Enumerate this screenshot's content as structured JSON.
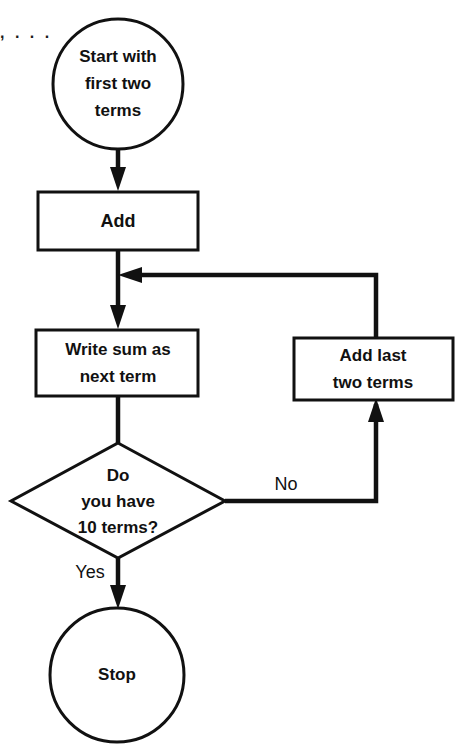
{
  "diagram": {
    "type": "flowchart",
    "background_color": "#ffffff",
    "stroke_color": "#111111",
    "fill_color": "#ffffff",
    "corner_fragment": ", . . ."
  },
  "nodes": {
    "start": {
      "shape": "circle",
      "lines": [
        "Start with",
        "first two",
        "terms"
      ],
      "line1": "Start with",
      "line2": "first two",
      "line3": "terms",
      "cx": 118,
      "cy": 84,
      "r": 65
    },
    "add": {
      "shape": "rectangle",
      "label": "Add",
      "x": 38,
      "y": 192,
      "w": 160,
      "h": 58
    },
    "write_sum": {
      "shape": "rectangle",
      "lines": [
        "Write sum as",
        "next term"
      ],
      "line1": "Write sum as",
      "line2": "next term",
      "x": 36,
      "y": 330,
      "w": 162,
      "h": 66
    },
    "decision": {
      "shape": "diamond",
      "lines": [
        "Do",
        "you have",
        "10 terms?"
      ],
      "line1": "Do",
      "line2": "you have",
      "line3": "10 terms?",
      "cx": 118,
      "cy": 501,
      "rx": 107,
      "ry": 58
    },
    "add_last_two": {
      "shape": "rectangle",
      "lines": [
        "Add last",
        "two terms"
      ],
      "line1": "Add last",
      "line2": "two terms",
      "x": 294,
      "y": 338,
      "w": 159,
      "h": 62
    },
    "stop": {
      "shape": "circle",
      "label": "Stop",
      "cx": 117,
      "cy": 675,
      "r": 67
    }
  },
  "edges": {
    "start_to_add": {
      "from": "start",
      "to": "add",
      "label": ""
    },
    "add_to_write_sum": {
      "from": "add",
      "to": "write_sum",
      "label": ""
    },
    "write_sum_to_decision": {
      "from": "write_sum",
      "to": "decision",
      "label": ""
    },
    "decision_no": {
      "from": "decision",
      "to": "add_last_two",
      "label": "No",
      "label_x": 286,
      "label_y": 489
    },
    "decision_yes": {
      "from": "decision",
      "to": "stop",
      "label": "Yes",
      "label_x": 90,
      "label_y": 578
    },
    "feedback": {
      "from": "add_last_two",
      "to": "add_to_write_sum_junction",
      "label": ""
    }
  },
  "labels": {
    "no": "No",
    "yes": "Yes"
  }
}
